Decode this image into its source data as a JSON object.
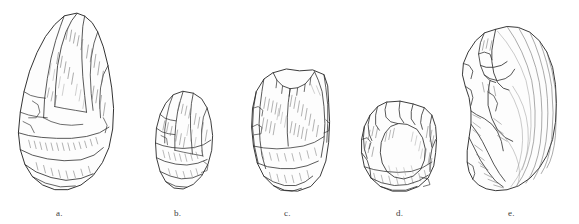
{
  "figure": {
    "kind": "archaeological-line-drawing-plate",
    "background_color": "#ffffff",
    "ink_color": "#2e2e2e",
    "shading_color": "#6a6a6a",
    "caption_color": "#3a3a3a",
    "width": 579,
    "height": 224,
    "artifact_count": 5
  },
  "artifacts": [
    {
      "label": "a.",
      "name": "pear-shaped-handaxe",
      "description": "Large teardrop / pear-shaped bifacial handaxe with pointed tip and broad rounded base",
      "x": 10,
      "y": 4,
      "w": 112,
      "h": 194,
      "caption_x": 56,
      "caption_y": 208
    },
    {
      "label": "b.",
      "name": "ovate-biface",
      "description": "Small oval egg-shaped bifacially flaked tool",
      "x": 150,
      "y": 86,
      "w": 70,
      "h": 112,
      "caption_x": 174,
      "caption_y": 208
    },
    {
      "label": "c.",
      "name": "rectangular-flake-tool",
      "description": "Trapezoidal retouched flake tool with notched upper margin",
      "x": 245,
      "y": 64,
      "w": 94,
      "h": 134,
      "caption_x": 284,
      "caption_y": 208
    },
    {
      "label": "d.",
      "name": "discoidal-core",
      "description": "Squarish rounded core with steep flaked perimeter and large central flake scar",
      "x": 355,
      "y": 98,
      "w": 90,
      "h": 100,
      "caption_x": 396,
      "caption_y": 208
    },
    {
      "label": "e.",
      "name": "large-flake-with-bulb-of-percussion",
      "description": "Large flake showing concentric ripple marks and prominent bulb of percussion on left margin",
      "x": 452,
      "y": 22,
      "w": 112,
      "h": 176,
      "caption_x": 508,
      "caption_y": 208
    }
  ]
}
